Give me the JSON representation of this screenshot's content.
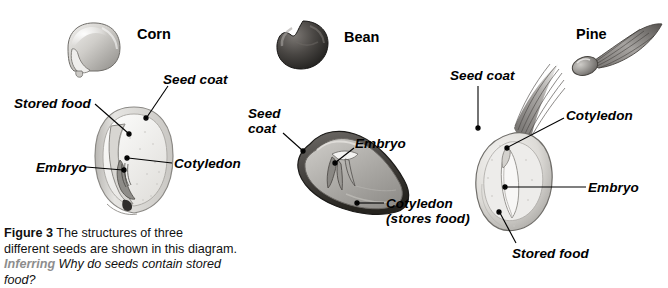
{
  "figure": {
    "panels": [
      {
        "name": "corn",
        "title": "Corn",
        "labels": [
          {
            "id": "stored-food",
            "text": "Stored food"
          },
          {
            "id": "seed-coat",
            "text": "Seed coat"
          },
          {
            "id": "embryo",
            "text": "Embryo"
          },
          {
            "id": "cotyledon",
            "text": "Cotyledon"
          }
        ]
      },
      {
        "name": "bean",
        "title": "Bean",
        "labels": [
          {
            "id": "seed-coat-line1",
            "text": "Seed"
          },
          {
            "id": "seed-coat-line2",
            "text": "coat"
          },
          {
            "id": "embryo",
            "text": "Embryo"
          },
          {
            "id": "cotyledon-line1",
            "text": "Cotyledon"
          },
          {
            "id": "cotyledon-line2",
            "text": "(stores food)"
          }
        ]
      },
      {
        "name": "pine",
        "title": "Pine",
        "labels": [
          {
            "id": "seed-coat",
            "text": "Seed coat"
          },
          {
            "id": "cotyledon",
            "text": "Cotyledon"
          },
          {
            "id": "embryo",
            "text": "Embryo"
          },
          {
            "id": "stored-food",
            "text": "Stored food"
          }
        ]
      }
    ],
    "caption": {
      "figure_number": "Figure 3",
      "line1": "The structures of three",
      "line2": "different seeds are shown in this diagram.",
      "skill": "Inferring",
      "question": "Why do seeds contain stored food?"
    }
  },
  "colors": {
    "text": "#000000",
    "skill_gray": "#8d8d8d",
    "leader": "#000000",
    "seed_light": "#e8e7e4",
    "seed_mid": "#b3b1ad",
    "seed_dark": "#5d5b58",
    "bean_dark": "#3b3936"
  }
}
